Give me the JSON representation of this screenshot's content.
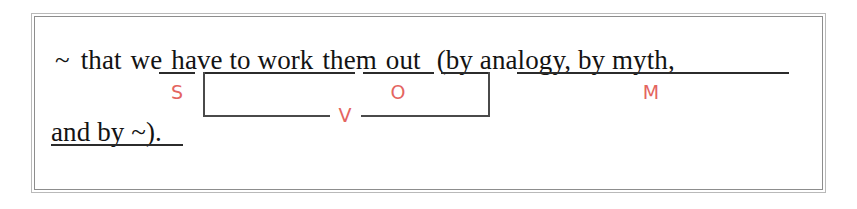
{
  "diagram": {
    "type": "sentence-structure-analysis",
    "colors": {
      "text": "#131313",
      "label": "#e4655f",
      "rule": "#2b2b2b",
      "bracket": "#4a4a4a",
      "frame_outer": "#b9b9b9",
      "frame_inner": "#8d8d8d",
      "background": "#ffffff"
    },
    "lines": [
      {
        "id": "line1",
        "text": "~ that we have to work them out (by analogy, by myth,"
      },
      {
        "id": "line2",
        "text": "and by ~)."
      }
    ],
    "line1": {
      "placeholder": "~",
      "conjunction": "that",
      "subject": "we",
      "verb_part1": "have to work",
      "object": "them",
      "verb_part2": "out",
      "modifier": "(by analogy, by myth,"
    },
    "line2": {
      "modifier_cont": "and by ~",
      "closing": ")."
    },
    "labels": [
      {
        "id": "label-s",
        "text": "S",
        "meaning": "subject"
      },
      {
        "id": "label-v",
        "text": "V",
        "meaning": "verb"
      },
      {
        "id": "label-o",
        "text": "O",
        "meaning": "object"
      },
      {
        "id": "label-m",
        "text": "M",
        "meaning": "modifier"
      }
    ]
  }
}
